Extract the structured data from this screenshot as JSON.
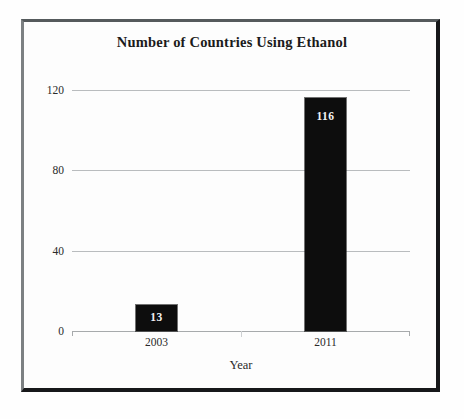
{
  "chart_data": {
    "type": "bar",
    "title": "Number of Countries Using Ethanol",
    "xlabel": "Year",
    "ylabel": "",
    "categories": [
      "2003",
      "2011"
    ],
    "values": [
      13,
      116
    ],
    "data_labels": [
      "13",
      "116"
    ],
    "ylim": [
      0,
      120
    ],
    "yticks": [
      0,
      40,
      80,
      120
    ],
    "ytick_labels": [
      "0",
      "40",
      "80",
      "120"
    ],
    "grid": "horizontal",
    "legend": null,
    "bar_color": "#0d0d0d",
    "gridline_color": "#b9bcbe",
    "label_text_color": "#f2f2f2",
    "background_color": "#fdfdfd",
    "frame_color": "#17181a"
  },
  "figure": {
    "title": "Number of Countries Using Ethanol",
    "x_axis_title": "Year"
  }
}
